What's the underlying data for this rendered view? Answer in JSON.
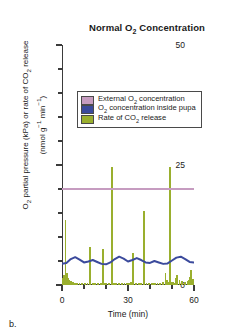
{
  "panel": {
    "letter": "b."
  },
  "chart_data": {
    "type": "line",
    "title": "Normal O2 Concentration",
    "title_html": "Normal O<sub>2</sub> Concentration",
    "xlabel": "Time (min)",
    "ylabel": "O2 partial pressure (kPa) or rate of CO2 release (nmol g-1 min-1)",
    "ylabel_line1_html": "O<sub>2</sub> partial pressure (kPa) or rate of CO<sub>2</sub> release",
    "ylabel_line2_html": "(nmol g<sup>&minus;1</sup> min<sup>&minus;1</sup>)",
    "xlim": [
      0,
      60
    ],
    "ylim": [
      0,
      50
    ],
    "grid": false,
    "x_major_ticks": [
      0,
      30,
      60
    ],
    "x_major_tick_labels": [
      "0",
      "30",
      "60"
    ],
    "x_minor_ticks": [
      10,
      20,
      40,
      50
    ],
    "y_major_ticks": [
      0,
      25,
      50
    ],
    "y_major_tick_labels": [
      "0",
      "25",
      "50"
    ],
    "y_minor_ticks": [
      5,
      10,
      15,
      20,
      30,
      35,
      40,
      45
    ],
    "legend_position": "upper-center",
    "series": [
      {
        "name": "External O2 concentration",
        "name_html": "External O<sub>2</sub> concentration",
        "type": "line",
        "color": "#c69cc0",
        "constant_value": 20,
        "x": [
          0,
          60
        ],
        "values": [
          20,
          20
        ]
      },
      {
        "name": "O2 concentration inside pupa",
        "name_html": "O<sub>2</sub> concentration inside pupa",
        "type": "line",
        "color": "#3b4a9c",
        "x": [
          0,
          2,
          4,
          6,
          8,
          10,
          12,
          14,
          16,
          18,
          20,
          22,
          24,
          26,
          28,
          30,
          32,
          34,
          36,
          38,
          40,
          42,
          44,
          46,
          48,
          50,
          52,
          54,
          56,
          58,
          60
        ],
        "values": [
          4.4,
          4.6,
          5.4,
          5.8,
          5.3,
          4.7,
          4.9,
          5.2,
          4.8,
          4.4,
          4.3,
          4.7,
          5.4,
          5.9,
          5.5,
          4.9,
          5.2,
          5.6,
          5.2,
          4.7,
          4.6,
          5.0,
          4.7,
          4.4,
          4.5,
          5.1,
          5.7,
          5.9,
          5.4,
          4.8,
          4.7
        ]
      },
      {
        "name": "Rate of CO2 release",
        "name_html": "Rate of CO<sub>2</sub> release",
        "type": "bar",
        "color": "#9aaf2e",
        "x": [
          0.4,
          1.0,
          1.6,
          2.2,
          2.8,
          3.4,
          4.0,
          4.6,
          5.2,
          5.8,
          6.4,
          7.0,
          8.0,
          9.2,
          10.4,
          11.6,
          12.8,
          14.0,
          14.6,
          15.2,
          16.4,
          17.6,
          18.8,
          19.6,
          20.2,
          21.4,
          22.6,
          23.6,
          24.2,
          24.8,
          26.0,
          27.2,
          28.4,
          29.6,
          30.6,
          31.2,
          32.4,
          33.6,
          34.8,
          35.4,
          36.0,
          37.2,
          38.4,
          39.6,
          40.8,
          41.6,
          42.2,
          43.4,
          44.6,
          45.8,
          47.0,
          47.8,
          48.4,
          49.0,
          49.6,
          50.4,
          51.0,
          51.6,
          52.2,
          53.4,
          54.6,
          55.8,
          57.0,
          57.6,
          58.2,
          58.8,
          59.4
        ],
        "values": [
          1.4,
          2.0,
          13.6,
          2.4,
          1.4,
          1.0,
          0.8,
          0.7,
          0.6,
          0.5,
          0.4,
          0.4,
          0.4,
          0.5,
          0.4,
          0.5,
          8.0,
          0.5,
          0.4,
          0.4,
          0.4,
          0.5,
          7.4,
          0.5,
          0.4,
          0.4,
          24.6,
          0.5,
          0.4,
          0.4,
          0.4,
          0.5,
          0.4,
          0.5,
          0.5,
          0.6,
          6.6,
          0.5,
          0.4,
          0.4,
          0.5,
          15.4,
          0.5,
          0.4,
          0.4,
          0.5,
          0.4,
          0.5,
          0.5,
          0.6,
          2.6,
          1.0,
          0.6,
          24.6,
          0.7,
          0.6,
          0.5,
          1.4,
          2.0,
          1.0,
          0.8,
          0.7,
          0.8,
          1.0,
          1.6,
          3.2,
          1.2
        ]
      }
    ],
    "legend_entries": [
      {
        "label": "External O2 concentration",
        "color": "#c69cc0"
      },
      {
        "label": "O2 concentration inside pupa",
        "color": "#3b4a9c"
      },
      {
        "label": "Rate of CO2 release",
        "color": "#9aaf2e"
      }
    ]
  }
}
